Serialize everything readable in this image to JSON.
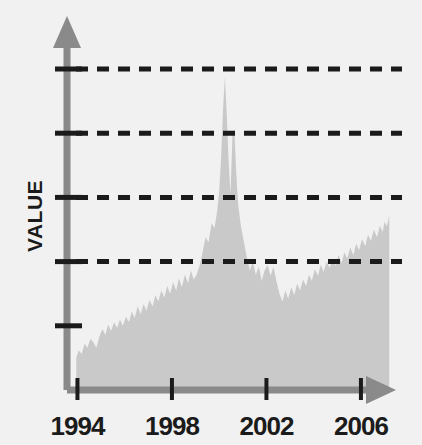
{
  "chart_data": {
    "type": "area",
    "title": "",
    "subtitle": "",
    "xlabel": "",
    "ylabel": "VALUE",
    "grid": true,
    "legend": null,
    "legend_position": "none",
    "xlim": [
      1993.6,
      2007.4
    ],
    "ylim": [
      0,
      5
    ],
    "xtick_labels": [
      "1994",
      "1998",
      "2002",
      "2006"
    ],
    "xtick_values": [
      1994,
      1998,
      2002,
      2006
    ],
    "ytick_labels": [
      "",
      "",
      "",
      "",
      ""
    ],
    "ytick_values": [
      1,
      2,
      3,
      4,
      5
    ],
    "gridline_values": [
      2,
      3,
      4,
      5
    ],
    "colors": {
      "background": "#f2f1f1",
      "area_fill": "#c9c9c9",
      "axis": "#8a8a8a",
      "gridline": "#1b1b1b",
      "text": "#1b1b1b"
    },
    "x": [
      1993.95,
      1994.05,
      1994.18,
      1994.3,
      1994.42,
      1994.55,
      1994.68,
      1994.8,
      1994.92,
      1995.05,
      1995.18,
      1995.3,
      1995.42,
      1995.55,
      1995.68,
      1995.8,
      1995.92,
      1996.05,
      1996.18,
      1996.3,
      1996.42,
      1996.55,
      1996.68,
      1996.8,
      1996.92,
      1997.05,
      1997.18,
      1997.3,
      1997.42,
      1997.55,
      1997.68,
      1997.8,
      1997.92,
      1998.05,
      1998.18,
      1998.3,
      1998.42,
      1998.55,
      1998.68,
      1998.8,
      1998.92,
      1999.05,
      1999.18,
      1999.3,
      1999.42,
      1999.55,
      1999.68,
      1999.8,
      1999.92,
      2000.0,
      2000.08,
      2000.16,
      2000.24,
      2000.32,
      2000.4,
      2000.48,
      2000.56,
      2000.64,
      2000.72,
      2000.8,
      2000.92,
      2001.05,
      2001.18,
      2001.3,
      2001.42,
      2001.55,
      2001.68,
      2001.8,
      2001.92,
      2002.05,
      2002.18,
      2002.3,
      2002.42,
      2002.55,
      2002.68,
      2002.8,
      2002.92,
      2003.05,
      2003.18,
      2003.3,
      2003.42,
      2003.55,
      2003.68,
      2003.8,
      2003.92,
      2004.05,
      2004.18,
      2004.3,
      2004.42,
      2004.55,
      2004.68,
      2004.8,
      2004.92,
      2005.05,
      2005.18,
      2005.3,
      2005.42,
      2005.55,
      2005.68,
      2005.8,
      2005.92,
      2006.05,
      2006.18,
      2006.3,
      2006.42,
      2006.55,
      2006.68,
      2006.8,
      2006.92,
      2007.0,
      2007.1,
      2007.2
    ],
    "y": [
      0.5,
      0.62,
      0.56,
      0.72,
      0.66,
      0.8,
      0.74,
      0.66,
      0.82,
      0.95,
      0.86,
      1.02,
      0.92,
      1.05,
      0.97,
      1.1,
      1.0,
      1.14,
      1.06,
      1.22,
      1.12,
      1.3,
      1.18,
      1.34,
      1.24,
      1.4,
      1.3,
      1.48,
      1.38,
      1.55,
      1.44,
      1.62,
      1.5,
      1.68,
      1.55,
      1.74,
      1.6,
      1.8,
      1.66,
      1.86,
      1.72,
      1.8,
      1.95,
      2.15,
      2.38,
      2.3,
      2.6,
      2.52,
      2.8,
      3.1,
      3.6,
      4.35,
      4.88,
      4.3,
      3.55,
      3.05,
      3.95,
      4.05,
      3.4,
      2.9,
      2.55,
      2.3,
      2.05,
      1.86,
      2.0,
      1.8,
      1.92,
      1.7,
      1.86,
      1.95,
      1.78,
      1.92,
      1.7,
      1.5,
      1.38,
      1.55,
      1.42,
      1.6,
      1.48,
      1.66,
      1.55,
      1.72,
      1.62,
      1.8,
      1.7,
      1.88,
      1.78,
      1.95,
      1.84,
      2.0,
      1.9,
      2.05,
      1.94,
      2.1,
      1.98,
      2.14,
      2.05,
      2.22,
      2.1,
      2.28,
      2.18,
      2.35,
      2.24,
      2.42,
      2.32,
      2.5,
      2.38,
      2.56,
      2.46,
      2.62,
      2.55,
      2.72
    ]
  },
  "axis": {
    "y_title": "VALUE",
    "x_labels": [
      {
        "text": "1994",
        "value": 1994
      },
      {
        "text": "1998",
        "value": 1998
      },
      {
        "text": "2002",
        "value": 2002
      },
      {
        "text": "2006",
        "value": 2006
      }
    ]
  }
}
